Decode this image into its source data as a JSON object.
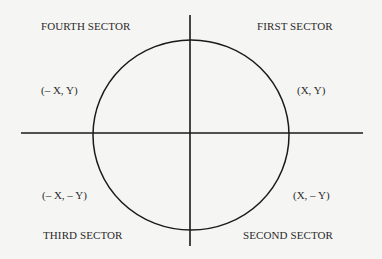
{
  "diagram": {
    "type": "coordinate-plane-circle",
    "colors": {
      "background": "#f5f5f3",
      "stroke": "#1a1a1a",
      "text": "#2a2a2a"
    },
    "axes": {
      "horizontal": {
        "x1": 21,
        "x2": 363,
        "y": 133
      },
      "vertical": {
        "x": 190,
        "y1": 15,
        "y2": 246
      }
    },
    "circle": {
      "cx": 191,
      "cy": 135,
      "rx": 98,
      "ry": 95
    },
    "sectors": {
      "first": {
        "name": "FIRST SECTOR",
        "coords": "(X, Y)"
      },
      "second": {
        "name": "SECOND SECTOR",
        "coords": "(X, – Y)"
      },
      "third": {
        "name": "THIRD SECTOR",
        "coords": "(– X, – Y)"
      },
      "fourth": {
        "name": "FOURTH SECTOR",
        "coords": "(– X, Y)"
      }
    }
  }
}
